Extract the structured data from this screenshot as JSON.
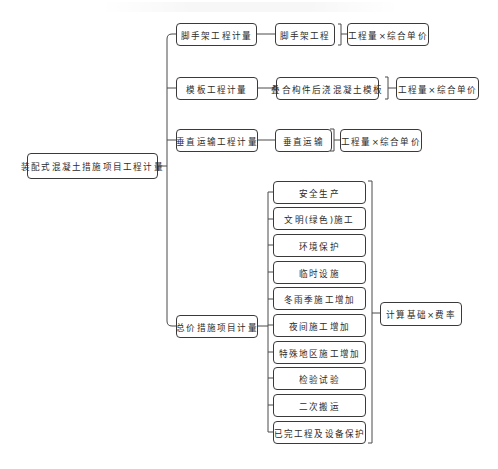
{
  "diagram": {
    "root": {
      "label": "装配式混凝土措施项目工程计量"
    },
    "branches": [
      {
        "label": "脚手架工程计量",
        "child": "脚手架工程",
        "formula": "工程量×综合单价"
      },
      {
        "label": "模板工程计量",
        "child": "叠合构件后浇混凝土模板",
        "formula": "工程量×综合单价"
      },
      {
        "label": "垂直运输工程计量",
        "child": "垂直运输",
        "formula": "工程量×综合单价"
      },
      {
        "label": "总价措施项目计量",
        "children": [
          "安全生产",
          "文明(绿色)施工",
          "环境保护",
          "临时设施",
          "冬雨季施工增加",
          "夜间施工增加",
          "特殊地区施工增加",
          "检验试验",
          "二次搬运",
          "已完工程及设备保护"
        ],
        "formula": "计算基础×费率"
      }
    ],
    "colors": {
      "line": "#4a4a4a",
      "border": "#3a3a3a",
      "text": "#2b2b2b",
      "background": "#ffffff"
    }
  }
}
